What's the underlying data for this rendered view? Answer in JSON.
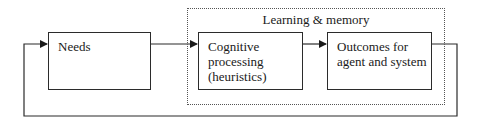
{
  "diagram": {
    "type": "flow",
    "group": {
      "title": "Learning & memory",
      "style": "dotted"
    },
    "nodes": [
      {
        "id": "needs",
        "label": "Needs"
      },
      {
        "id": "cognitive",
        "label": "Cognitive\nprocessing\n(heuristics)"
      },
      {
        "id": "outcomes",
        "label": "Outcomes for\nagent and system"
      }
    ],
    "edges": [
      {
        "from": "needs",
        "to": "cognitive"
      },
      {
        "from": "cognitive",
        "to": "outcomes"
      },
      {
        "from": "outcomes",
        "to": "needs",
        "kind": "feedback-loop"
      }
    ],
    "colors": {
      "line": "#2b2b2b",
      "group_border": "#555555",
      "background": "#ffffff"
    }
  }
}
